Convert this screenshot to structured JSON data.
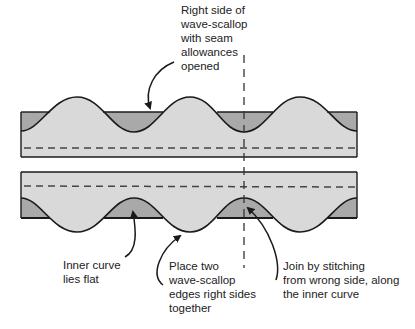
{
  "labels": {
    "top": "Right side of\nwave-scallop\nwith seam\nallowances\nopened",
    "inner_curve": "Inner curve\nlies flat",
    "place": "Place two\nwave-scallop\nedges right sides\ntogether",
    "join": "Join by stitching\nfrom wrong side, along\nthe inner curve"
  },
  "colors": {
    "light_fabric": "#d9d9d9",
    "dark_fabric": "#a9a9a9",
    "outline": "#1a1a1a",
    "dash": "#444444"
  }
}
